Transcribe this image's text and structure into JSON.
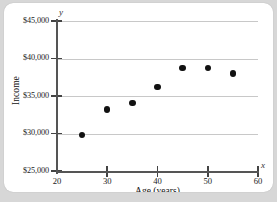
{
  "chart_data": {
    "type": "scatter",
    "title": "",
    "xlabel": "Age (years)",
    "ylabel": "Income",
    "x_axis_symbol": "x",
    "y_axis_symbol": "y",
    "xlim": [
      20,
      60
    ],
    "ylim": [
      25000,
      45000
    ],
    "xticks": [
      20,
      30,
      40,
      50,
      60
    ],
    "xticklabels": [
      "20",
      "30",
      "40",
      "50",
      "60"
    ],
    "yticks": [
      25000,
      30000,
      35000,
      40000,
      45000
    ],
    "yticklabels": [
      "$25,000",
      "$30,000",
      "$35,000",
      "$40,000",
      "$45,000"
    ],
    "grid": "horizontal",
    "legend": "none",
    "x": [
      25,
      30,
      35,
      40,
      45,
      50,
      55
    ],
    "values": [
      29800,
      33200,
      34100,
      36200,
      38700,
      38700,
      38000
    ],
    "points": [
      {
        "x": 25,
        "y": 29800
      },
      {
        "x": 30,
        "y": 33200
      },
      {
        "x": 35,
        "y": 34100
      },
      {
        "x": 40,
        "y": 36200
      },
      {
        "x": 45,
        "y": 38700
      },
      {
        "x": 50,
        "y": 38700
      },
      {
        "x": 55,
        "y": 38000
      }
    ],
    "marker_color": "#111111",
    "gridline_color": "#c8c8c8",
    "axis_color": "#555555",
    "background_color": "#ffffff",
    "page_background_color": "#d7d7d7"
  }
}
